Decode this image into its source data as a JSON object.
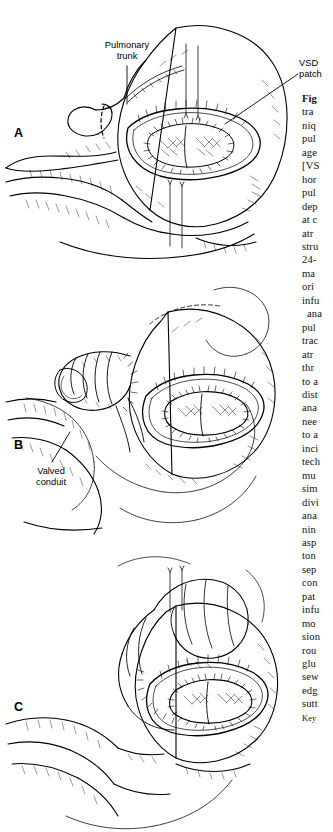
{
  "page": {
    "kind": "book-figure-page",
    "background": "#ffffff",
    "ink": "#000000"
  },
  "figure": {
    "panels": [
      {
        "id": "A",
        "letter": "A",
        "description": "Anterior view of the heart with the right ventricular infundibulum opened, showing the VSD patch in place and the transected pulmonary trunk retracted"
      },
      {
        "id": "B",
        "letter": "B",
        "description": "Valved conduit anastomosed to the distal pulmonary artery, proximal end left long for trimming"
      },
      {
        "id": "C",
        "letter": "C",
        "description": "Completed repair with the proximal conduit hood sutured to the right ventriculotomy"
      }
    ],
    "annotations": [
      {
        "name": "pulmonary-trunk",
        "text": "Pulmonary\ntrunk"
      },
      {
        "name": "vsd-patch",
        "text": "VSD\npatch"
      },
      {
        "name": "valved-conduit",
        "text": "Valved\nconduit"
      }
    ]
  },
  "caption": {
    "clipped": true,
    "lines": [
      {
        "text": "Fig",
        "bold": true
      },
      {
        "text": "tra"
      },
      {
        "text": "niq"
      },
      {
        "text": "pul"
      },
      {
        "text": "age"
      },
      {
        "text": "[VS"
      },
      {
        "text": "hor"
      },
      {
        "text": "pul"
      },
      {
        "text": "dep"
      },
      {
        "text": "at c"
      },
      {
        "text": "atr"
      },
      {
        "text": "stru"
      },
      {
        "text": "24-"
      },
      {
        "text": "ma"
      },
      {
        "text": "ori"
      },
      {
        "text": "infu"
      },
      {
        "text": "ana",
        "indent": true
      },
      {
        "text": "pul"
      },
      {
        "text": "trac"
      },
      {
        "text": "atr"
      },
      {
        "text": "thr"
      },
      {
        "text": "to a"
      },
      {
        "text": "dist"
      },
      {
        "text": "ana"
      },
      {
        "text": "nee"
      },
      {
        "text": "to a"
      },
      {
        "text": "inci"
      },
      {
        "text": "tech"
      },
      {
        "text": "mu"
      },
      {
        "text": "sim"
      },
      {
        "text": "divi"
      },
      {
        "text": "ana"
      },
      {
        "text": "nin"
      },
      {
        "text": "asp"
      },
      {
        "text": "ton"
      },
      {
        "text": "sep"
      },
      {
        "text": "con"
      },
      {
        "text": "pat"
      },
      {
        "text": "infu"
      },
      {
        "text": "mo"
      },
      {
        "text": "sion"
      },
      {
        "text": "rou"
      },
      {
        "text": "glu"
      },
      {
        "text": "sew"
      },
      {
        "text": "edg"
      },
      {
        "text": "sutt"
      },
      {
        "text": "Key",
        "key": true
      }
    ]
  }
}
